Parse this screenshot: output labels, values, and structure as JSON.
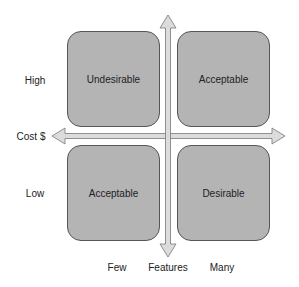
{
  "diagram": {
    "type": "2x2 matrix",
    "quadrants": [
      {
        "position": "top-left",
        "label": "Undesirable"
      },
      {
        "position": "top-right",
        "label": "Acceptable"
      },
      {
        "position": "bottom-left",
        "label": "Acceptable"
      },
      {
        "position": "bottom-right",
        "label": "Desirable"
      }
    ],
    "y_axis": {
      "label": "Cost $",
      "high": "High",
      "low": "Low"
    },
    "x_axis": {
      "label": "Features",
      "low": "Few",
      "high": "Many"
    },
    "colors": {
      "box_fill": "#b4b4b4",
      "box_border": "#555555",
      "arrow_fill": "#dcdcdc",
      "arrow_stroke": "#777777"
    }
  }
}
